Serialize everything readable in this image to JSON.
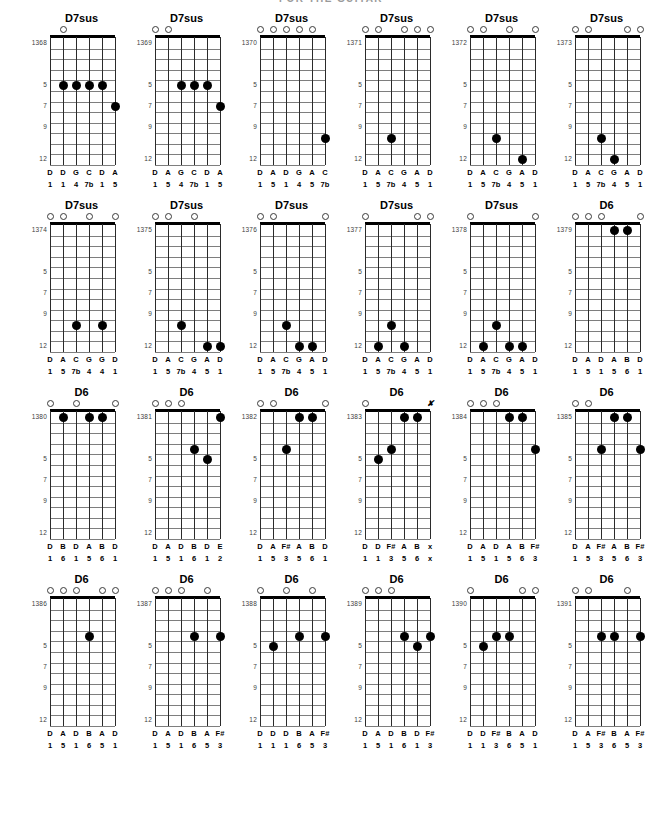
{
  "page": {
    "title": "FOR THE GUITAR",
    "fret_labels": [
      "5",
      "7",
      "9",
      "12"
    ],
    "fret_label_positions": [
      5,
      7,
      9,
      12
    ],
    "string_count": 6,
    "fret_count": 12
  },
  "chords": [
    {
      "number": "1368",
      "name": "D7sus",
      "markers": [
        "",
        "o",
        "",
        "",
        "",
        ""
      ],
      "dots": [
        {
          "string": 2,
          "fret": 5
        },
        {
          "string": 3,
          "fret": 5
        },
        {
          "string": 4,
          "fret": 5
        },
        {
          "string": 5,
          "fret": 5
        },
        {
          "string": 6,
          "fret": 7
        }
      ],
      "notes": [
        "D",
        "D",
        "G",
        "C",
        "D",
        "A"
      ],
      "degrees": [
        "1",
        "1",
        "4",
        "7b",
        "1",
        "5"
      ]
    },
    {
      "number": "1369",
      "name": "D7sus",
      "markers": [
        "o",
        "o",
        "",
        "",
        "",
        ""
      ],
      "dots": [
        {
          "string": 3,
          "fret": 5
        },
        {
          "string": 4,
          "fret": 5
        },
        {
          "string": 5,
          "fret": 5
        },
        {
          "string": 6,
          "fret": 7
        }
      ],
      "notes": [
        "D",
        "A",
        "G",
        "C",
        "D",
        "A"
      ],
      "degrees": [
        "1",
        "5",
        "4",
        "7b",
        "1",
        "5"
      ]
    },
    {
      "number": "1370",
      "name": "D7sus",
      "markers": [
        "o",
        "o",
        "o",
        "o",
        "o",
        ""
      ],
      "dots": [
        {
          "string": 6,
          "fret": 10
        }
      ],
      "notes": [
        "D",
        "A",
        "D",
        "G",
        "A",
        "C"
      ],
      "degrees": [
        "1",
        "5",
        "1",
        "4",
        "5",
        "7b"
      ]
    },
    {
      "number": "1371",
      "name": "D7sus",
      "markers": [
        "o",
        "o",
        "",
        "o",
        "o",
        "o"
      ],
      "dots": [
        {
          "string": 3,
          "fret": 10
        }
      ],
      "notes": [
        "D",
        "A",
        "C",
        "G",
        "A",
        "D"
      ],
      "degrees": [
        "1",
        "5",
        "7b",
        "4",
        "5",
        "1"
      ]
    },
    {
      "number": "1372",
      "name": "D7sus",
      "markers": [
        "o",
        "o",
        "",
        "o",
        "",
        "o"
      ],
      "dots": [
        {
          "string": 3,
          "fret": 10
        },
        {
          "string": 5,
          "fret": 12
        }
      ],
      "notes": [
        "D",
        "A",
        "C",
        "G",
        "A",
        "D"
      ],
      "degrees": [
        "1",
        "5",
        "7b",
        "4",
        "5",
        "1"
      ]
    },
    {
      "number": "1373",
      "name": "D7sus",
      "markers": [
        "o",
        "o",
        "",
        "",
        "o",
        "o"
      ],
      "dots": [
        {
          "string": 3,
          "fret": 10
        },
        {
          "string": 4,
          "fret": 12
        }
      ],
      "notes": [
        "D",
        "A",
        "C",
        "G",
        "A",
        "D"
      ],
      "degrees": [
        "1",
        "5",
        "7b",
        "4",
        "5",
        "1"
      ]
    },
    {
      "number": "1374",
      "name": "D7sus",
      "markers": [
        "o",
        "o",
        "",
        "o",
        "",
        "o"
      ],
      "dots": [
        {
          "string": 3,
          "fret": 10
        },
        {
          "string": 5,
          "fret": 10
        }
      ],
      "notes": [
        "D",
        "A",
        "C",
        "G",
        "G",
        "D"
      ],
      "degrees": [
        "1",
        "5",
        "7b",
        "4",
        "4",
        "1"
      ]
    },
    {
      "number": "1375",
      "name": "D7sus",
      "markers": [
        "o",
        "o",
        "",
        "o",
        "",
        ""
      ],
      "dots": [
        {
          "string": 3,
          "fret": 10
        },
        {
          "string": 5,
          "fret": 12
        },
        {
          "string": 6,
          "fret": 12
        }
      ],
      "notes": [
        "D",
        "A",
        "C",
        "G",
        "A",
        "D"
      ],
      "degrees": [
        "1",
        "5",
        "7b",
        "4",
        "5",
        "1"
      ]
    },
    {
      "number": "1376",
      "name": "D7sus",
      "markers": [
        "o",
        "o",
        "",
        "",
        "",
        "o"
      ],
      "dots": [
        {
          "string": 3,
          "fret": 10
        },
        {
          "string": 4,
          "fret": 12
        },
        {
          "string": 5,
          "fret": 12
        }
      ],
      "notes": [
        "D",
        "A",
        "C",
        "G",
        "A",
        "D"
      ],
      "degrees": [
        "1",
        "5",
        "7b",
        "4",
        "5",
        "1"
      ]
    },
    {
      "number": "1377",
      "name": "D7sus",
      "markers": [
        "o",
        "",
        "",
        "",
        "o",
        "o"
      ],
      "dots": [
        {
          "string": 2,
          "fret": 12
        },
        {
          "string": 3,
          "fret": 10
        },
        {
          "string": 4,
          "fret": 12
        }
      ],
      "notes": [
        "D",
        "A",
        "C",
        "G",
        "A",
        "D"
      ],
      "degrees": [
        "1",
        "5",
        "7b",
        "4",
        "5",
        "1"
      ]
    },
    {
      "number": "1378",
      "name": "D7sus",
      "markers": [
        "o",
        "",
        "",
        "",
        "",
        "o"
      ],
      "dots": [
        {
          "string": 2,
          "fret": 12
        },
        {
          "string": 3,
          "fret": 10
        },
        {
          "string": 4,
          "fret": 12
        },
        {
          "string": 5,
          "fret": 12
        }
      ],
      "notes": [
        "D",
        "A",
        "C",
        "G",
        "A",
        "D"
      ],
      "degrees": [
        "1",
        "5",
        "7b",
        "4",
        "5",
        "1"
      ]
    },
    {
      "number": "1379",
      "name": "D6",
      "markers": [
        "o",
        "o",
        "o",
        "",
        "",
        "o"
      ],
      "dots": [
        {
          "string": 4,
          "fret": 1
        },
        {
          "string": 5,
          "fret": 1
        }
      ],
      "notes": [
        "D",
        "A",
        "D",
        "A",
        "B",
        "D"
      ],
      "degrees": [
        "1",
        "5",
        "1",
        "5",
        "6",
        "1"
      ]
    },
    {
      "number": "1380",
      "name": "D6",
      "markers": [
        "o",
        "",
        "o",
        "",
        "",
        "o"
      ],
      "dots": [
        {
          "string": 2,
          "fret": 1
        },
        {
          "string": 4,
          "fret": 1
        },
        {
          "string": 5,
          "fret": 1
        }
      ],
      "notes": [
        "D",
        "B",
        "D",
        "A",
        "B",
        "D"
      ],
      "degrees": [
        "1",
        "6",
        "1",
        "5",
        "6",
        "1"
      ]
    },
    {
      "number": "1381",
      "name": "D6",
      "markers": [
        "o",
        "o",
        "o",
        "",
        "",
        ""
      ],
      "dots": [
        {
          "string": 4,
          "fret": 4
        },
        {
          "string": 5,
          "fret": 5
        },
        {
          "string": 6,
          "fret": 1
        }
      ],
      "notes": [
        "D",
        "A",
        "D",
        "B",
        "D",
        "E"
      ],
      "degrees": [
        "1",
        "5",
        "1",
        "6",
        "1",
        "2"
      ]
    },
    {
      "number": "1382",
      "name": "D6",
      "markers": [
        "o",
        "o",
        "",
        "",
        "",
        "o"
      ],
      "dots": [
        {
          "string": 3,
          "fret": 4
        },
        {
          "string": 4,
          "fret": 1
        },
        {
          "string": 5,
          "fret": 1
        }
      ],
      "notes": [
        "D",
        "A",
        "F#",
        "A",
        "B",
        "D"
      ],
      "degrees": [
        "1",
        "5",
        "3",
        "5",
        "6",
        "1"
      ]
    },
    {
      "number": "1383",
      "name": "D6",
      "markers": [
        "o",
        "",
        "",
        "",
        "",
        "x"
      ],
      "dots": [
        {
          "string": 2,
          "fret": 5
        },
        {
          "string": 3,
          "fret": 4
        },
        {
          "string": 4,
          "fret": 1
        },
        {
          "string": 5,
          "fret": 1
        }
      ],
      "notes": [
        "D",
        "D",
        "F#",
        "A",
        "B",
        "x"
      ],
      "degrees": [
        "1",
        "1",
        "3",
        "5",
        "6",
        "x"
      ]
    },
    {
      "number": "1384",
      "name": "D6",
      "markers": [
        "o",
        "o",
        "o",
        "",
        "",
        ""
      ],
      "dots": [
        {
          "string": 4,
          "fret": 1
        },
        {
          "string": 5,
          "fret": 1
        },
        {
          "string": 6,
          "fret": 4
        }
      ],
      "notes": [
        "D",
        "A",
        "D",
        "A",
        "B",
        "F#"
      ],
      "degrees": [
        "1",
        "5",
        "1",
        "5",
        "6",
        "3"
      ]
    },
    {
      "number": "1385",
      "name": "D6",
      "markers": [
        "o",
        "o",
        "",
        "",
        "",
        ""
      ],
      "dots": [
        {
          "string": 3,
          "fret": 4
        },
        {
          "string": 4,
          "fret": 1
        },
        {
          "string": 5,
          "fret": 1
        },
        {
          "string": 6,
          "fret": 4
        }
      ],
      "notes": [
        "D",
        "A",
        "F#",
        "A",
        "B",
        "F#"
      ],
      "degrees": [
        "1",
        "5",
        "3",
        "5",
        "6",
        "3"
      ]
    },
    {
      "number": "1386",
      "name": "D6",
      "markers": [
        "o",
        "o",
        "o",
        "",
        "o",
        "o"
      ],
      "dots": [
        {
          "string": 4,
          "fret": 4
        }
      ],
      "notes": [
        "D",
        "A",
        "D",
        "B",
        "A",
        "D"
      ],
      "degrees": [
        "1",
        "5",
        "1",
        "6",
        "5",
        "1"
      ]
    },
    {
      "number": "1387",
      "name": "D6",
      "markers": [
        "o",
        "o",
        "o",
        "",
        "o",
        ""
      ],
      "dots": [
        {
          "string": 4,
          "fret": 4
        },
        {
          "string": 6,
          "fret": 4
        }
      ],
      "notes": [
        "D",
        "A",
        "D",
        "B",
        "A",
        "F#"
      ],
      "degrees": [
        "1",
        "5",
        "1",
        "6",
        "5",
        "3"
      ]
    },
    {
      "number": "1388",
      "name": "D6",
      "markers": [
        "o",
        "",
        "o",
        "",
        "o",
        ""
      ],
      "dots": [
        {
          "string": 2,
          "fret": 5
        },
        {
          "string": 4,
          "fret": 4
        },
        {
          "string": 6,
          "fret": 4
        }
      ],
      "notes": [
        "D",
        "D",
        "D",
        "B",
        "A",
        "F#"
      ],
      "degrees": [
        "1",
        "1",
        "1",
        "6",
        "5",
        "3"
      ]
    },
    {
      "number": "1389",
      "name": "D6",
      "markers": [
        "o",
        "o",
        "o",
        "",
        "",
        ""
      ],
      "dots": [
        {
          "string": 4,
          "fret": 4
        },
        {
          "string": 5,
          "fret": 5
        },
        {
          "string": 6,
          "fret": 4
        }
      ],
      "notes": [
        "D",
        "A",
        "D",
        "B",
        "D",
        "F#"
      ],
      "degrees": [
        "1",
        "5",
        "1",
        "6",
        "1",
        "3"
      ]
    },
    {
      "number": "1390",
      "name": "D6",
      "markers": [
        "o",
        "",
        "",
        "",
        "o",
        "o"
      ],
      "dots": [
        {
          "string": 2,
          "fret": 5
        },
        {
          "string": 3,
          "fret": 4
        },
        {
          "string": 4,
          "fret": 4
        }
      ],
      "notes": [
        "D",
        "D",
        "F#",
        "B",
        "A",
        "D"
      ],
      "degrees": [
        "1",
        "1",
        "3",
        "6",
        "5",
        "1"
      ]
    },
    {
      "number": "1391",
      "name": "D6",
      "markers": [
        "o",
        "o",
        "",
        "",
        "o",
        ""
      ],
      "dots": [
        {
          "string": 3,
          "fret": 4
        },
        {
          "string": 4,
          "fret": 4
        },
        {
          "string": 6,
          "fret": 4
        }
      ],
      "notes": [
        "D",
        "A",
        "F#",
        "B",
        "A",
        "F#"
      ],
      "degrees": [
        "1",
        "5",
        "3",
        "6",
        "5",
        "3"
      ]
    }
  ]
}
